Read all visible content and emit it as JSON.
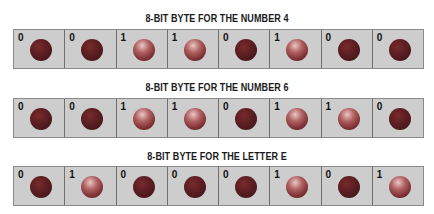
{
  "bytes": [
    {
      "title": "8-BIT BYTE FOR THE NUMBER 4",
      "bits": [
        "0",
        "0",
        "1",
        "1",
        "0",
        "1",
        "0",
        "0"
      ]
    },
    {
      "title": "8-BIT BYTE FOR THE NUMBER 6",
      "bits": [
        "0",
        "0",
        "1",
        "1",
        "0",
        "1",
        "1",
        "0"
      ]
    },
    {
      "title": "8-BIT BYTE FOR THE LETTER E",
      "bits": [
        "0",
        "1",
        "0",
        "0",
        "0",
        "1",
        "0",
        "1"
      ]
    }
  ],
  "colors": {
    "cell_background": "#cdcdcd",
    "cell_border": "#6e6e6e",
    "ball_off": "#5a1e22",
    "ball_on_highlight": "#e9c7c4"
  }
}
